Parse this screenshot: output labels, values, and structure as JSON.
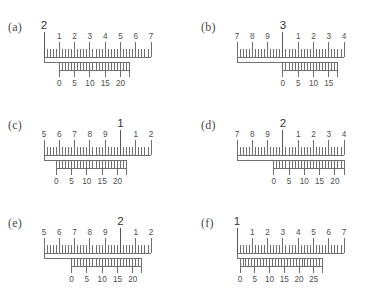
{
  "figure": {
    "panel_count": 6,
    "ink_color": "#6f6f6f",
    "background": "#ffffff"
  },
  "panels": [
    {
      "tag": "(a)",
      "main_scale": {
        "big_label": "2",
        "big_index": 0,
        "labels": [
          "2",
          "1",
          "2",
          "3",
          "4",
          "5",
          "6",
          "7"
        ],
        "minor_per_unit": 5
      },
      "vernier_scale": {
        "labels": [
          "0",
          "5",
          "10",
          "15",
          "20"
        ],
        "minor_per_label": 5,
        "start_unit_index": 1.0,
        "span_units": 4.6
      }
    },
    {
      "tag": "(b)",
      "main_scale": {
        "big_label": "3",
        "big_index": 3,
        "labels": [
          "7",
          "8",
          "9",
          "3",
          "1",
          "2",
          "3",
          "4"
        ],
        "minor_per_unit": 5
      },
      "vernier_scale": {
        "labels": [
          "0",
          "5",
          "10",
          "15"
        ],
        "minor_per_label": 5,
        "start_unit_index": 3.0,
        "span_units": 3.6
      }
    },
    {
      "tag": "(c)",
      "main_scale": {
        "big_label": "1",
        "big_index": 5,
        "labels": [
          "5",
          "6",
          "7",
          "8",
          "9",
          "1",
          "1",
          "2"
        ],
        "minor_per_unit": 5
      },
      "vernier_scale": {
        "labels": [
          "0",
          "5",
          "10",
          "15",
          "20"
        ],
        "minor_per_label": 5,
        "start_unit_index": 0.8,
        "span_units": 4.6
      }
    },
    {
      "tag": "(d)",
      "main_scale": {
        "big_label": "2",
        "big_index": 3,
        "labels": [
          "7",
          "8",
          "9",
          "2",
          "1",
          "2",
          "3",
          "4"
        ],
        "minor_per_unit": 5
      },
      "vernier_scale": {
        "labels": [
          "0",
          "5",
          "10",
          "15",
          "20"
        ],
        "minor_per_label": 5,
        "start_unit_index": 2.4,
        "span_units": 4.6
      }
    },
    {
      "tag": "(e)",
      "main_scale": {
        "big_label": "2",
        "big_index": 5,
        "labels": [
          "5",
          "6",
          "7",
          "8",
          "9",
          "2",
          "1",
          "2"
        ],
        "minor_per_unit": 5
      },
      "vernier_scale": {
        "labels": [
          "0",
          "5",
          "10",
          "15",
          "20"
        ],
        "minor_per_label": 5,
        "start_unit_index": 1.8,
        "span_units": 4.6
      }
    },
    {
      "tag": "(f)",
      "main_scale": {
        "big_label": "1",
        "big_index": 0,
        "labels": [
          "1",
          "1",
          "2",
          "3",
          "4",
          "5",
          "6",
          "7"
        ],
        "minor_per_unit": 5
      },
      "vernier_scale": {
        "labels": [
          "0",
          "5",
          "10",
          "15",
          "20",
          "25"
        ],
        "minor_per_label": 5,
        "start_unit_index": 0.2,
        "span_units": 5.4
      }
    }
  ]
}
